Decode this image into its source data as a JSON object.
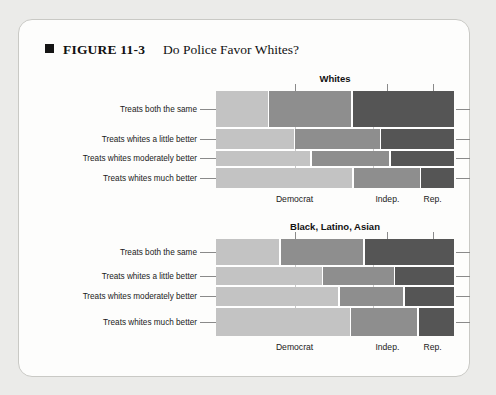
{
  "figure": {
    "bullet": "black-square",
    "number": "FIGURE 11-3",
    "title": "Do Police Favor Whites?"
  },
  "colors": {
    "democrat": "#c3c3c3",
    "independent": "#8e8e8e",
    "republican": "#555555",
    "gap": "#ffffff",
    "card_bg": "#fdfdfc",
    "page_bg": "#ebebe9",
    "axis": "#8a8a8a",
    "text": "#1a1a1a"
  },
  "row_labels": [
    "Treats both the same",
    "Treats whites a little better",
    "Treats whites moderately better",
    "Treats whites much better"
  ],
  "column_labels": [
    "Democrat",
    "Indep.",
    "Rep."
  ],
  "chart_data": [
    {
      "type": "heatmap",
      "subtype": "mosaic",
      "title": "Whites",
      "xlabel": "",
      "ylabel": "",
      "categories": [
        "Treats both the same",
        "Treats whites a little better",
        "Treats whites moderately better",
        "Treats whites much better"
      ],
      "series": [
        {
          "name": "Democrat",
          "values": [
            22,
            33,
            40,
            58
          ]
        },
        {
          "name": "Indep.",
          "values": [
            35,
            36,
            33,
            28
          ]
        },
        {
          "name": "Rep.",
          "values": [
            43,
            31,
            27,
            14
          ]
        }
      ],
      "row_heights_pct": [
        40,
        21,
        17,
        22
      ],
      "xlim": [
        0,
        100
      ],
      "ylim": [
        0,
        100
      ],
      "grid": true,
      "legend": "none",
      "note": "Mosaic plot: row height = share of respondents giving that answer; segment width = party composition within that answer."
    },
    {
      "type": "heatmap",
      "subtype": "mosaic",
      "title": "Black, Latino, Asian",
      "xlabel": "",
      "ylabel": "",
      "categories": [
        "Treats both the same",
        "Treats whites a little better",
        "Treats whites moderately better",
        "Treats whites much better"
      ],
      "series": [
        {
          "name": "Democrat",
          "values": [
            27,
            45,
            52,
            57
          ]
        },
        {
          "name": "Indep.",
          "values": [
            35,
            30,
            27,
            28
          ]
        },
        {
          "name": "Rep.",
          "values": [
            38,
            25,
            21,
            15
          ]
        }
      ],
      "row_heights_pct": [
        29,
        19,
        21,
        31
      ],
      "xlim": [
        0,
        100
      ],
      "ylim": [
        0,
        100
      ],
      "grid": true,
      "legend": "none",
      "note": "Mosaic plot: row height = share of respondents giving that answer; segment width = party composition within that answer."
    }
  ]
}
